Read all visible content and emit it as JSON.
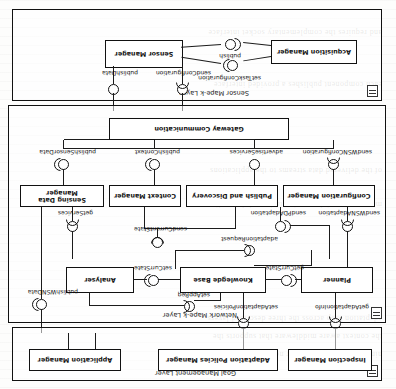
{
  "diagram": {
    "orientation": "rotated-180",
    "layers": [
      {
        "id": "sensor",
        "name": "Sensor Mape-k Layer"
      },
      {
        "id": "network",
        "name": "Network Mape-k Layer"
      },
      {
        "id": "goal",
        "name": "Goal Management Layer"
      }
    ],
    "components": [
      {
        "id": "acquisition-manager",
        "label": "Acquisition Manager"
      },
      {
        "id": "sensor-manager",
        "label": "Sensor Manager"
      },
      {
        "id": "gateway-communication",
        "label": "Gateway Communication"
      },
      {
        "id": "configuration-manager",
        "label": "Configuration Manager"
      },
      {
        "id": "publish-and-discovery",
        "label": "Publish and Discovery"
      },
      {
        "id": "context-manager",
        "label": "Context Manager"
      },
      {
        "id": "sensing-data-manager",
        "label": "Sensing Data Manager"
      },
      {
        "id": "planner",
        "label": "Planner"
      },
      {
        "id": "knowlegde-base",
        "label": "Knowlegde Base"
      },
      {
        "id": "analyser",
        "label": "Analyser"
      },
      {
        "id": "inspection-manager",
        "label": "Inspection Manager"
      },
      {
        "id": "adaptation-policies-manager",
        "label": "Adaptation Policies Manager"
      },
      {
        "id": "application-manager",
        "label": "Application Manager"
      }
    ],
    "interfaces": [
      {
        "id": "set-task-configuration",
        "label": "setTaskConfiguration"
      },
      {
        "id": "publish",
        "label": "publish"
      },
      {
        "id": "send-configuration",
        "label": "sendConfiguration"
      },
      {
        "id": "publish-data",
        "label": "publishData"
      },
      {
        "id": "send-wsn-configuration",
        "label": "sendWSNConfiguration"
      },
      {
        "id": "advertise-services",
        "label": "advertiseServices"
      },
      {
        "id": "publish-context",
        "label": "publishContext"
      },
      {
        "id": "publish-sensor-data",
        "label": "publishSensorData"
      },
      {
        "id": "send-wsn-adaptation",
        "label": "sendWSNAdaptation"
      },
      {
        "id": "send-pd-adaptation",
        "label": "sendPDAdaptation"
      },
      {
        "id": "adaptation-request",
        "label": "adaptationRequest"
      },
      {
        "id": "send-curr-ent-state",
        "label": "sendCurrentState"
      },
      {
        "id": "get-services",
        "label": "getServices"
      },
      {
        "id": "get-curr-state",
        "label": "getCurrState"
      },
      {
        "id": "set-curr-state",
        "label": "setCurrState"
      },
      {
        "id": "set-app-req",
        "label": "setAppReq"
      },
      {
        "id": "get-adaptation-info",
        "label": "getAdaptationInfo"
      },
      {
        "id": "set-adaptation-policies",
        "label": "setAdaptationPolicies"
      },
      {
        "id": "publish-wsn-data",
        "label": "publishWSNData"
      }
    ],
    "background_text": [
      "a printed conference paper page shows through behind the figure"
    ]
  }
}
